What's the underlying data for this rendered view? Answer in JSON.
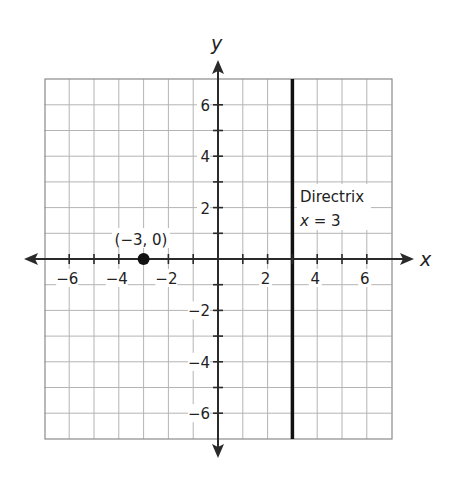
{
  "chart_data": {
    "type": "scatter",
    "title": "",
    "xlabel": "x",
    "ylabel": "y",
    "xlim": [
      -7,
      7
    ],
    "ylim": [
      -7,
      7
    ],
    "grid": true,
    "grid_step": 1,
    "x_tick_labels": [
      "-6",
      "-4",
      "-2",
      "2",
      "4",
      "6"
    ],
    "x_tick_values": [
      -6,
      -4,
      -2,
      2,
      4,
      6
    ],
    "y_tick_labels": [
      "6",
      "4",
      "2",
      "-2",
      "-4",
      "-6"
    ],
    "y_tick_values": [
      6,
      4,
      2,
      -2,
      -4,
      -6
    ],
    "points": [
      {
        "x": -3,
        "y": 0,
        "label": "(−3, 0)"
      }
    ],
    "lines": [
      {
        "type": "vertical",
        "x": 3,
        "label_line1": "Directrix",
        "label_line2": "x = 3"
      }
    ],
    "annotations": [
      "(−3, 0)",
      "Directrix",
      "x = 3"
    ]
  },
  "labels": {
    "x_axis": "x",
    "y_axis": "y",
    "point": "(−3, 0)",
    "directrix_title": "Directrix",
    "directrix_eq_var": "x",
    "directrix_eq_rest": " = 3",
    "x_ticks": [
      "−6",
      "−4",
      "−2",
      "2",
      "4",
      "6"
    ],
    "y_ticks": [
      "6",
      "4",
      "2",
      "−2",
      "−4",
      "−6"
    ]
  },
  "colors": {
    "grid": "#b4b4b4",
    "border": "#8a8a8a",
    "axis": "#2a2a2a",
    "directrix": "#111111",
    "point": "#111111"
  }
}
